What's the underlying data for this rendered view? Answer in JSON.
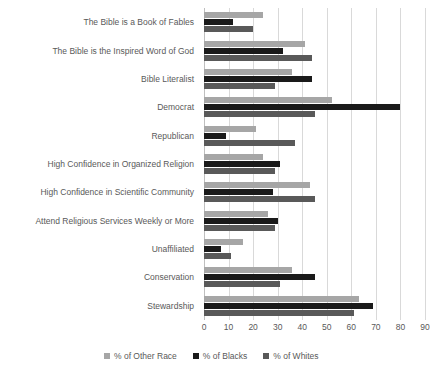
{
  "chart_data": {
    "type": "bar",
    "orientation": "horizontal",
    "title": "",
    "xlabel": "",
    "ylabel": "",
    "xlim": [
      0,
      90
    ],
    "xticks": [
      0,
      10,
      20,
      30,
      40,
      50,
      60,
      70,
      80,
      90
    ],
    "grid": true,
    "legend_position": "bottom",
    "categories": [
      "The Bible is a Book of Fables",
      "The Bible is the Inspired Word of God",
      "Bible Literalist",
      "Democrat",
      "Republican",
      "High Confidence in Organized Religion",
      "High Confidence in Scientific Community",
      "Attend Religious Services Weekly or More",
      "Unaffiliated",
      "Conservation",
      "Stewardship"
    ],
    "series": [
      {
        "name": "% of Other Race",
        "color": "#a6a6a6",
        "values": [
          24,
          41,
          36,
          52,
          21,
          24,
          43,
          26,
          16,
          36,
          63
        ]
      },
      {
        "name": "% of Blacks",
        "color": "#1a1a1a",
        "values": [
          12,
          32,
          44,
          80,
          9,
          31,
          28,
          30,
          7,
          45,
          69
        ]
      },
      {
        "name": "% of Whites",
        "color": "#595959",
        "values": [
          20,
          44,
          29,
          45,
          37,
          29,
          45,
          29,
          11,
          31,
          61
        ]
      }
    ]
  },
  "legend": {
    "items": [
      {
        "label": "% of Other Race",
        "swatch": "s-other"
      },
      {
        "label": "% of Blacks",
        "swatch": "s-black"
      },
      {
        "label": "% of Whites",
        "swatch": "s-white"
      }
    ]
  },
  "colors": {
    "other_race": "#a6a6a6",
    "blacks": "#1a1a1a",
    "whites": "#595959",
    "gridline": "#d9d9d9",
    "axis": "#bfbfbf",
    "text": "#595959",
    "background": "#ffffff"
  }
}
